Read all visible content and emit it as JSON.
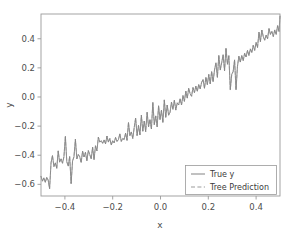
{
  "figure": {
    "background_color": "#ffffff",
    "width": 290,
    "height": 238
  },
  "chart_data": {
    "type": "line",
    "title": "",
    "xlabel": "x",
    "ylabel": "y",
    "xlim": [
      -0.5,
      0.5
    ],
    "ylim": [
      -0.68,
      0.57
    ],
    "xticks": [
      -0.4,
      -0.2,
      0.0,
      0.2,
      0.4
    ],
    "xtick_labels": [
      "−0.4",
      "−0.2",
      "0.0",
      "0.2",
      "0.4"
    ],
    "yticks": [
      -0.6,
      -0.4,
      -0.2,
      0.0,
      0.2,
      0.4
    ],
    "ytick_labels": [
      "−0.6",
      "−0.4",
      "−0.2",
      "0.0",
      "0.2",
      "0.4"
    ],
    "grid": false,
    "legend_position": "lower right",
    "line_color": "#6e6e6e",
    "prediction_color": "#8a8a8a",
    "series": [
      {
        "name": "True y",
        "style": "solid",
        "color": "#6e6e6e",
        "x": [
          -0.5,
          -0.494,
          -0.488,
          -0.482,
          -0.476,
          -0.47,
          -0.464,
          -0.458,
          -0.452,
          -0.446,
          -0.44,
          -0.434,
          -0.428,
          -0.422,
          -0.416,
          -0.41,
          -0.404,
          -0.398,
          -0.392,
          -0.386,
          -0.38,
          -0.374,
          -0.368,
          -0.362,
          -0.356,
          -0.35,
          -0.344,
          -0.338,
          -0.332,
          -0.326,
          -0.32,
          -0.314,
          -0.308,
          -0.302,
          -0.296,
          -0.29,
          -0.284,
          -0.278,
          -0.272,
          -0.266,
          -0.26,
          -0.254,
          -0.248,
          -0.242,
          -0.236,
          -0.23,
          -0.224,
          -0.218,
          -0.212,
          -0.206,
          -0.2,
          -0.194,
          -0.188,
          -0.182,
          -0.176,
          -0.17,
          -0.164,
          -0.158,
          -0.152,
          -0.146,
          -0.14,
          -0.134,
          -0.128,
          -0.122,
          -0.116,
          -0.11,
          -0.104,
          -0.098,
          -0.092,
          -0.086,
          -0.08,
          -0.074,
          -0.068,
          -0.062,
          -0.056,
          -0.05,
          -0.044,
          -0.038,
          -0.032,
          -0.026,
          -0.02,
          -0.014,
          -0.008,
          -0.002,
          0.004,
          0.01,
          0.016,
          0.022,
          0.028,
          0.034,
          0.04,
          0.046,
          0.052,
          0.058,
          0.064,
          0.07,
          0.076,
          0.082,
          0.088,
          0.094,
          0.1,
          0.106,
          0.112,
          0.118,
          0.124,
          0.13,
          0.136,
          0.142,
          0.148,
          0.154,
          0.16,
          0.166,
          0.172,
          0.178,
          0.184,
          0.19,
          0.196,
          0.202,
          0.208,
          0.214,
          0.22,
          0.226,
          0.232,
          0.238,
          0.244,
          0.25,
          0.256,
          0.262,
          0.268,
          0.274,
          0.28,
          0.286,
          0.292,
          0.298,
          0.304,
          0.31,
          0.316,
          0.322,
          0.328,
          0.334,
          0.34,
          0.346,
          0.352,
          0.358,
          0.364,
          0.37,
          0.376,
          0.382,
          0.388,
          0.394,
          0.4,
          0.406,
          0.412,
          0.418,
          0.424,
          0.43,
          0.436,
          0.442,
          0.448,
          0.454,
          0.46,
          0.466,
          0.472,
          0.478,
          0.484,
          0.49,
          0.496,
          0.5
        ],
        "y": [
          -0.545,
          -0.578,
          -0.555,
          -0.586,
          -0.552,
          -0.571,
          -0.63,
          -0.452,
          -0.402,
          -0.478,
          -0.452,
          -0.49,
          -0.37,
          -0.448,
          -0.425,
          -0.455,
          -0.41,
          -0.27,
          -0.445,
          -0.475,
          -0.408,
          -0.595,
          -0.44,
          -0.41,
          -0.29,
          -0.425,
          -0.395,
          -0.41,
          -0.45,
          -0.372,
          -0.412,
          -0.38,
          -0.438,
          -0.368,
          -0.395,
          -0.425,
          -0.345,
          -0.43,
          -0.335,
          -0.37,
          -0.275,
          -0.31,
          -0.3,
          -0.318,
          -0.295,
          -0.322,
          -0.268,
          -0.31,
          -0.285,
          -0.33,
          -0.3,
          -0.315,
          -0.278,
          -0.305,
          -0.292,
          -0.253,
          -0.305,
          -0.285,
          -0.292,
          -0.248,
          -0.298,
          -0.175,
          -0.265,
          -0.24,
          -0.285,
          -0.21,
          -0.145,
          -0.265,
          -0.195,
          -0.26,
          -0.125,
          -0.235,
          -0.165,
          -0.238,
          -0.105,
          -0.205,
          -0.155,
          -0.22,
          -0.038,
          -0.19,
          -0.13,
          -0.205,
          -0.06,
          -0.155,
          -0.09,
          -0.175,
          -0.02,
          -0.14,
          -0.055,
          -0.125,
          -0.105,
          -0.035,
          -0.085,
          -0.022,
          -0.09,
          -0.04,
          -0.055,
          -0.012,
          -0.055,
          0.01,
          -0.03,
          0.04,
          -0.008,
          0.06,
          0.022,
          0.005,
          0.065,
          0.03,
          0.075,
          0.04,
          0.085,
          0.055,
          0.1,
          0.12,
          0.06,
          0.135,
          0.085,
          0.155,
          0.09,
          0.175,
          0.105,
          0.185,
          0.235,
          0.135,
          0.285,
          0.185,
          0.235,
          0.29,
          0.18,
          0.335,
          0.225,
          0.285,
          0.05,
          0.155,
          0.175,
          0.255,
          0.05,
          0.21,
          0.28,
          0.24,
          0.285,
          0.25,
          0.3,
          0.275,
          0.32,
          0.285,
          0.33,
          0.305,
          0.355,
          0.32,
          0.375,
          0.34,
          0.445,
          0.38,
          0.46,
          0.415,
          0.39,
          0.425,
          0.4,
          0.47,
          0.43,
          0.45,
          0.415,
          0.46,
          0.43,
          0.49,
          0.45,
          0.555
        ]
      },
      {
        "name": "Tree Prediction",
        "style": "dashed",
        "color": "#8a8a8a",
        "x": [
          -0.5,
          -0.494,
          -0.488,
          -0.482,
          -0.476,
          -0.47,
          -0.464,
          -0.458,
          -0.452,
          -0.446,
          -0.44,
          -0.434,
          -0.428,
          -0.422,
          -0.416,
          -0.41,
          -0.404,
          -0.398,
          -0.392,
          -0.386,
          -0.38,
          -0.374,
          -0.368,
          -0.362,
          -0.356,
          -0.35,
          -0.344,
          -0.338,
          -0.332,
          -0.326,
          -0.32,
          -0.314,
          -0.308,
          -0.302,
          -0.296,
          -0.29,
          -0.284,
          -0.278,
          -0.272,
          -0.266,
          -0.26,
          -0.254,
          -0.248,
          -0.242,
          -0.236,
          -0.23,
          -0.224,
          -0.218,
          -0.212,
          -0.206,
          -0.2,
          -0.194,
          -0.188,
          -0.182,
          -0.176,
          -0.17,
          -0.164,
          -0.158,
          -0.152,
          -0.146,
          -0.14,
          -0.134,
          -0.128,
          -0.122,
          -0.116,
          -0.11,
          -0.104,
          -0.098,
          -0.092,
          -0.086,
          -0.08,
          -0.074,
          -0.068,
          -0.062,
          -0.056,
          -0.05,
          -0.044,
          -0.038,
          -0.032,
          -0.026,
          -0.02,
          -0.014,
          -0.008,
          -0.002,
          0.004,
          0.01,
          0.016,
          0.022,
          0.028,
          0.034,
          0.04,
          0.046,
          0.052,
          0.058,
          0.064,
          0.07,
          0.076,
          0.082,
          0.088,
          0.094,
          0.1,
          0.106,
          0.112,
          0.118,
          0.124,
          0.13,
          0.136,
          0.142,
          0.148,
          0.154,
          0.16,
          0.166,
          0.172,
          0.178,
          0.184,
          0.19,
          0.196,
          0.202,
          0.208,
          0.214,
          0.22,
          0.226,
          0.232,
          0.238,
          0.244,
          0.25,
          0.256,
          0.262,
          0.268,
          0.274,
          0.28,
          0.286,
          0.292,
          0.298,
          0.304,
          0.31,
          0.316,
          0.322,
          0.328,
          0.334,
          0.34,
          0.346,
          0.352,
          0.358,
          0.364,
          0.37,
          0.376,
          0.382,
          0.388,
          0.394,
          0.4,
          0.406,
          0.412,
          0.418,
          0.424,
          0.43,
          0.436,
          0.442,
          0.448,
          0.454,
          0.46,
          0.466,
          0.472,
          0.478,
          0.484,
          0.49,
          0.496,
          0.5
        ],
        "y": [
          -0.545,
          -0.578,
          -0.555,
          -0.586,
          -0.552,
          -0.571,
          -0.63,
          -0.452,
          -0.402,
          -0.478,
          -0.452,
          -0.49,
          -0.37,
          -0.448,
          -0.425,
          -0.455,
          -0.41,
          -0.27,
          -0.445,
          -0.475,
          -0.408,
          -0.595,
          -0.44,
          -0.41,
          -0.29,
          -0.425,
          -0.395,
          -0.41,
          -0.45,
          -0.372,
          -0.412,
          -0.38,
          -0.438,
          -0.368,
          -0.395,
          -0.425,
          -0.345,
          -0.43,
          -0.335,
          -0.37,
          -0.275,
          -0.31,
          -0.3,
          -0.318,
          -0.295,
          -0.322,
          -0.268,
          -0.31,
          -0.285,
          -0.33,
          -0.3,
          -0.315,
          -0.278,
          -0.305,
          -0.292,
          -0.253,
          -0.305,
          -0.285,
          -0.292,
          -0.248,
          -0.298,
          -0.175,
          -0.265,
          -0.24,
          -0.285,
          -0.21,
          -0.145,
          -0.265,
          -0.195,
          -0.26,
          -0.125,
          -0.235,
          -0.165,
          -0.238,
          -0.105,
          -0.205,
          -0.155,
          -0.22,
          -0.038,
          -0.19,
          -0.13,
          -0.205,
          -0.06,
          -0.155,
          -0.09,
          -0.175,
          -0.02,
          -0.14,
          -0.055,
          -0.125,
          -0.105,
          -0.035,
          -0.085,
          -0.022,
          -0.09,
          -0.04,
          -0.055,
          -0.012,
          -0.055,
          0.01,
          -0.03,
          0.04,
          -0.008,
          0.06,
          0.022,
          0.005,
          0.065,
          0.03,
          0.075,
          0.04,
          0.085,
          0.055,
          0.1,
          0.12,
          0.06,
          0.135,
          0.085,
          0.155,
          0.09,
          0.175,
          0.105,
          0.185,
          0.235,
          0.135,
          0.285,
          0.185,
          0.235,
          0.29,
          0.18,
          0.335,
          0.225,
          0.285,
          0.05,
          0.155,
          0.175,
          0.255,
          0.05,
          0.21,
          0.28,
          0.24,
          0.285,
          0.25,
          0.3,
          0.275,
          0.32,
          0.285,
          0.33,
          0.305,
          0.355,
          0.32,
          0.375,
          0.34,
          0.445,
          0.38,
          0.46,
          0.415,
          0.39,
          0.425,
          0.4,
          0.47,
          0.43,
          0.45,
          0.415,
          0.46,
          0.43,
          0.49,
          0.45,
          0.555
        ]
      }
    ],
    "legend_entries": [
      {
        "label": "True y",
        "style": "solid"
      },
      {
        "label": "Tree Prediction",
        "style": "dashed"
      }
    ]
  }
}
